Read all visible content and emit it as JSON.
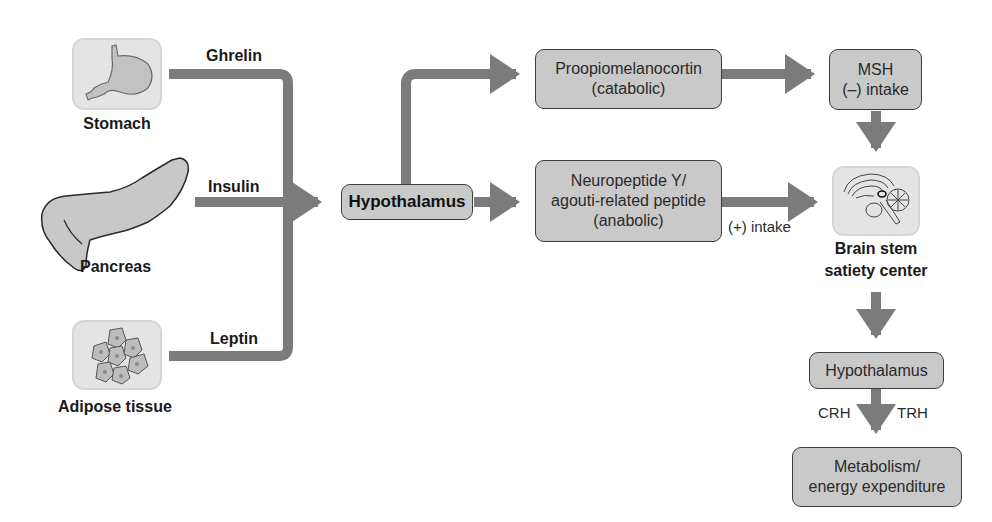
{
  "diagram": {
    "inputs": [
      {
        "organ": "Stomach",
        "signal": "Ghrelin"
      },
      {
        "organ": "Pancreas",
        "signal": "Insulin"
      },
      {
        "organ": "Adipose tissue",
        "signal": "Leptin"
      }
    ],
    "central": {
      "label": "Hypothalamus"
    },
    "pomc": {
      "line1": "Proopiomelanocortin",
      "line2": "(catabolic)"
    },
    "npy": {
      "line1": "Neuropeptide Y/",
      "line2": "agouti-related peptide",
      "line3": "(anabolic)"
    },
    "msh": {
      "line1": "MSH",
      "line2": "(–) intake"
    },
    "npy_edge_label": "(+) intake",
    "brainstem": {
      "line1": "Brain stem",
      "line2": "satiety center"
    },
    "hypothalamus2": {
      "label": "Hypothalamus"
    },
    "hormones": {
      "left": "CRH",
      "right": "TRH"
    },
    "metabolism": {
      "line1": "Metabolism/",
      "line2": "energy expenditure"
    },
    "colors": {
      "arrow": "#7b7b7b",
      "node_fill": "#c9c9c9",
      "node_border": "#3c3c3c",
      "organ_fill": "#e4e4e4"
    }
  }
}
